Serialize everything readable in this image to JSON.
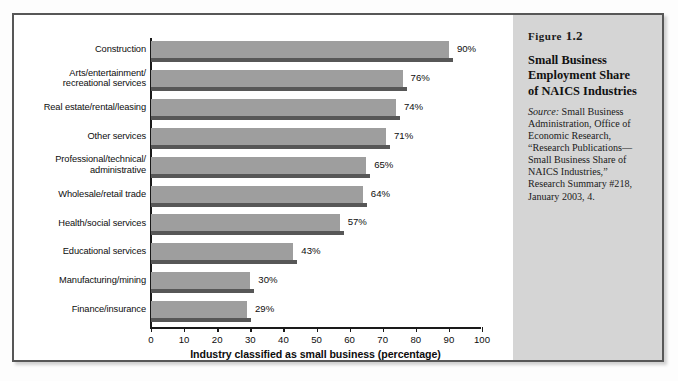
{
  "figure": {
    "number_word": "Figure",
    "number": "1.2",
    "title_lines": [
      "Small Business",
      "Employment Share",
      "of NAICS Industries"
    ],
    "source_word": "Source:",
    "source_text": " Small Business Administration, Office of Economic Research, “Research Publications—Small Business Share of NAICS Industries,” Research Summary #218, January 2003, 4."
  },
  "chart_data": {
    "type": "bar",
    "orientation": "horizontal",
    "xlabel": "Industry classified as small business (percentage)",
    "ylabel": "",
    "xlim": [
      0,
      100
    ],
    "grid": false,
    "legend": "none",
    "tick_labels": [
      "0",
      "10",
      "20",
      "30",
      "40",
      "50",
      "60",
      "70",
      "80",
      "90",
      "100"
    ],
    "ticks": [
      0,
      10,
      20,
      30,
      40,
      50,
      60,
      70,
      80,
      90,
      100
    ],
    "categories": [
      "Construction",
      "Arts/entertainment/ recreational services",
      "Real estate/rental/leasing",
      "Other services",
      "Professional/technical/ administrative",
      "Wholesale/retail trade",
      "Health/social services",
      "Educational services",
      "Manufacturing/mining",
      "Finance/insurance"
    ],
    "category_lines": [
      [
        "Construction"
      ],
      [
        "Arts/entertainment/",
        "recreational services"
      ],
      [
        "Real estate/rental/leasing"
      ],
      [
        "Other services"
      ],
      [
        "Professional/technical/",
        "administrative"
      ],
      [
        "Wholesale/retail trade"
      ],
      [
        "Health/social services"
      ],
      [
        "Educational services"
      ],
      [
        "Manufacturing/mining"
      ],
      [
        "Finance/insurance"
      ]
    ],
    "values": [
      90,
      76,
      74,
      71,
      65,
      64,
      57,
      43,
      30,
      29
    ],
    "value_labels": [
      "90%",
      "76%",
      "74%",
      "71%",
      "65%",
      "64%",
      "57%",
      "43%",
      "30%",
      "29%"
    ],
    "bar_color": "#9e9e9e",
    "bar_shadow_color": "#575757"
  },
  "colors": {
    "frame_border": "#575757",
    "caption_bg": "#d5d5d5",
    "axis": "#1a1a1a",
    "text": "#0d0d0d"
  }
}
